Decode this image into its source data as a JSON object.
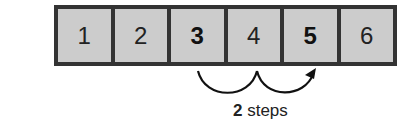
{
  "number_line": {
    "cells": [
      {
        "label": "1",
        "bold": false
      },
      {
        "label": "2",
        "bold": false
      },
      {
        "label": "3",
        "bold": true
      },
      {
        "label": "4",
        "bold": false
      },
      {
        "label": "5",
        "bold": true
      },
      {
        "label": "6",
        "bold": false
      }
    ],
    "colors": {
      "cell_fill": "#cccccc",
      "border": "#333333"
    }
  },
  "jumps": {
    "from": "3",
    "to": "5",
    "count": 2
  },
  "caption": {
    "number": "2",
    "text": " steps"
  }
}
